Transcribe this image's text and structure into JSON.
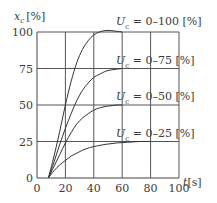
{
  "chart_data": {
    "type": "line",
    "title": "",
    "xlabel": "t[s]",
    "ylabel": "x_c [%]",
    "ylabel_main": "x",
    "ylabel_sub": "c",
    "ylabel_unit": "[%]",
    "xlabel_main": "t",
    "xlabel_unit": "[s]",
    "xlim": [
      0,
      100
    ],
    "ylim": [
      0,
      100
    ],
    "grid": true,
    "xticks": [
      "0",
      "20",
      "40",
      "60",
      "80",
      "100"
    ],
    "yticks": [
      "0",
      "25",
      "50",
      "75",
      "100"
    ],
    "series": [
      {
        "name": "U_c = 0–100 [%]",
        "label_main": "U",
        "label_sub": "c",
        "label_rest": " = 0–100 [%]",
        "x": [
          8,
          12,
          16,
          20,
          24,
          28,
          32,
          36,
          40,
          44,
          48,
          52,
          56,
          60
        ],
        "y": [
          0,
          15,
          32,
          50,
          66,
          79,
          88,
          94,
          98,
          100,
          101,
          101,
          100.5,
          100
        ]
      },
      {
        "name": "U_c = 0–75 [%]",
        "label_main": "U",
        "label_sub": "c",
        "label_rest": " = 0–75 [%]",
        "x": [
          8,
          12,
          16,
          20,
          24,
          28,
          32,
          36,
          40,
          44,
          48,
          52,
          56,
          60
        ],
        "y": [
          0,
          11,
          23,
          34,
          44,
          53,
          60,
          65,
          69,
          71,
          73,
          74,
          74.5,
          75
        ]
      },
      {
        "name": "U_c = 0–50 [%]",
        "label_main": "U",
        "label_sub": "c",
        "label_rest": " = 0–50 [%]",
        "x": [
          8,
          12,
          16,
          20,
          24,
          28,
          32,
          36,
          40,
          44,
          48,
          52,
          56,
          60
        ],
        "y": [
          0,
          8,
          16,
          24,
          31,
          37,
          41,
          44,
          46.5,
          48,
          49,
          49.5,
          50,
          50
        ]
      },
      {
        "name": "U_c = 0–25 [%]",
        "label_main": "U",
        "label_sub": "c",
        "label_rest": " = 0–25 [%]",
        "x": [
          8,
          12,
          16,
          20,
          24,
          28,
          32,
          36,
          40,
          48,
          56,
          64,
          72,
          80
        ],
        "y": [
          0,
          5,
          9,
          12,
          15,
          17,
          19,
          20.5,
          21.5,
          23,
          24,
          24.5,
          25,
          25
        ]
      }
    ]
  }
}
